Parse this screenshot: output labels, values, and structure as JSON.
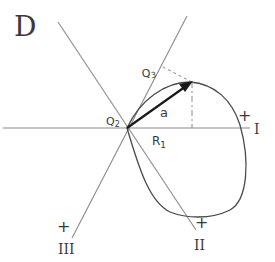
{
  "figure": {
    "panel_label": "D",
    "origin_label": "Q₂",
    "projection_label": "Q₃",
    "vector_label": "a",
    "radius_label": "R₁",
    "axes": [
      {
        "id": "I",
        "label": "I",
        "polarity": "+"
      },
      {
        "id": "II",
        "label": "II",
        "polarity": "+"
      },
      {
        "id": "III",
        "label": "III",
        "polarity": "+"
      }
    ],
    "colors": {
      "line": "#8a8a8a",
      "curve": "#4a4a4a",
      "vector": "#1a1a1a",
      "text": "#3a3a3a"
    }
  }
}
